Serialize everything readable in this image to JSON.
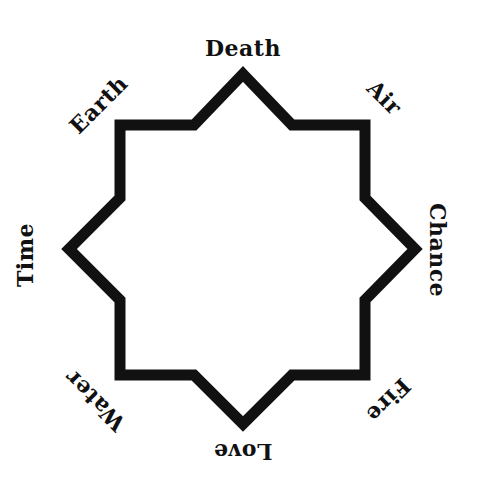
{
  "diagram": {
    "type": "eight-pointed star with labeled points",
    "stroke_color": "#111111",
    "background_color": "#ffffff",
    "labels": {
      "top": "Death",
      "top_right": "Air",
      "right": "Chance",
      "bottom_right": "Fire",
      "bottom": "Love",
      "bottom_left": "Water",
      "left": "Time",
      "top_left": "Earth"
    }
  }
}
